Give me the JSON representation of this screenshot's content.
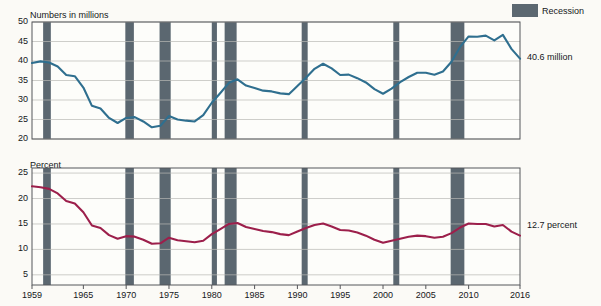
{
  "legend": {
    "label": "Recession",
    "color": "#5b6770"
  },
  "panels": [
    {
      "id": "poverty-number",
      "axis_title": "Numbers in millions",
      "yticks": [
        "20",
        "25",
        "30",
        "35",
        "40",
        "45",
        "50"
      ],
      "ymin": 20,
      "ymax": 50,
      "annotation": "Number in\npoverty",
      "annotation_line1": "Number in",
      "annotation_line2": "poverty",
      "end_label": "40.6 million",
      "line_color": "#2f6f8f"
    },
    {
      "id": "poverty-rate",
      "axis_title": "Percent",
      "yticks": [
        "5",
        "10",
        "15",
        "20",
        "25"
      ],
      "ymin": 3,
      "ymax": 26,
      "annotation": "Poverty rate",
      "end_label": "12.7 percent",
      "line_color": "#9c1f4b"
    }
  ],
  "xticks": [
    "1959",
    "1965",
    "1970",
    "1975",
    "1980",
    "1985",
    "1990",
    "1995",
    "2000",
    "2005",
    "2010",
    "2016"
  ],
  "chart_data": {
    "type": "line",
    "title": "",
    "xlabel": "",
    "grid": true,
    "legend_position": "top-right",
    "x": [
      1959,
      1960,
      1961,
      1962,
      1963,
      1964,
      1965,
      1966,
      1967,
      1968,
      1969,
      1970,
      1971,
      1972,
      1973,
      1974,
      1975,
      1976,
      1977,
      1978,
      1979,
      1980,
      1981,
      1982,
      1983,
      1984,
      1985,
      1986,
      1987,
      1988,
      1989,
      1990,
      1991,
      1992,
      1993,
      1994,
      1995,
      1996,
      1997,
      1998,
      1999,
      2000,
      2001,
      2002,
      2003,
      2004,
      2005,
      2006,
      2007,
      2008,
      2009,
      2010,
      2011,
      2012,
      2013,
      2014,
      2015,
      2016
    ],
    "series": [
      {
        "name": "Number in poverty",
        "panel": "poverty-number",
        "ylabel": "Numbers in millions",
        "ylim": [
          20,
          50
        ],
        "units": "millions",
        "last_value": 40.6,
        "last_value_label": "40.6 million",
        "color": "#2f6f8f",
        "values": [
          39.5,
          39.9,
          39.6,
          38.6,
          36.4,
          36.1,
          33.2,
          28.5,
          27.8,
          25.4,
          24.1,
          25.4,
          25.6,
          24.5,
          23.0,
          23.4,
          25.9,
          25.0,
          24.7,
          24.5,
          26.1,
          29.3,
          31.8,
          34.4,
          35.3,
          33.7,
          33.1,
          32.4,
          32.2,
          31.7,
          31.5,
          33.6,
          35.7,
          38.0,
          39.3,
          38.1,
          36.4,
          36.5,
          35.6,
          34.5,
          32.8,
          31.6,
          32.9,
          34.6,
          35.9,
          37.0,
          37.0,
          36.5,
          37.3,
          39.8,
          43.6,
          46.3,
          46.2,
          46.5,
          45.3,
          46.7,
          43.1,
          40.6
        ]
      },
      {
        "name": "Poverty rate",
        "panel": "poverty-rate",
        "ylabel": "Percent",
        "ylim": [
          3,
          26
        ],
        "units": "percent",
        "last_value": 12.7,
        "last_value_label": "12.7 percent",
        "color": "#9c1f4b",
        "values": [
          22.4,
          22.2,
          21.9,
          21.0,
          19.5,
          19.0,
          17.3,
          14.7,
          14.2,
          12.8,
          12.1,
          12.6,
          12.5,
          11.9,
          11.1,
          11.2,
          12.3,
          11.8,
          11.6,
          11.4,
          11.7,
          13.0,
          14.0,
          15.0,
          15.2,
          14.4,
          14.0,
          13.6,
          13.4,
          13.0,
          12.8,
          13.5,
          14.2,
          14.8,
          15.1,
          14.5,
          13.8,
          13.7,
          13.3,
          12.7,
          11.9,
          11.3,
          11.7,
          12.1,
          12.5,
          12.7,
          12.6,
          12.3,
          12.5,
          13.2,
          14.3,
          15.1,
          15.0,
          15.0,
          14.5,
          14.8,
          13.5,
          12.7
        ]
      }
    ],
    "recessions": [
      {
        "start": 1960.3,
        "end": 1961.2
      },
      {
        "start": 1969.9,
        "end": 1970.9
      },
      {
        "start": 1973.9,
        "end": 1975.2
      },
      {
        "start": 1980.0,
        "end": 1980.6
      },
      {
        "start": 1981.5,
        "end": 1982.9
      },
      {
        "start": 1990.5,
        "end": 1991.2
      },
      {
        "start": 2001.2,
        "end": 2001.9
      },
      {
        "start": 2007.9,
        "end": 2009.5
      }
    ]
  }
}
